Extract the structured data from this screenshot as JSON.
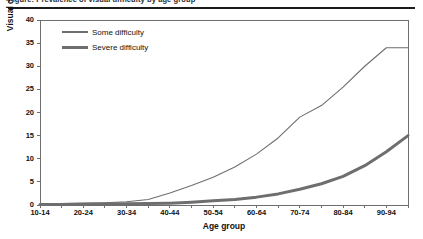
{
  "caption": {
    "text": "Figure: Prevalence of visual difficulty by age group"
  },
  "chart_data": {
    "type": "line",
    "title": "",
    "xlabel": "Age group",
    "ylabel": "Visual difficulty (%)",
    "ylim": [
      0,
      40
    ],
    "yticks": [
      0,
      5,
      10,
      15,
      20,
      25,
      30,
      35,
      40
    ],
    "grid": false,
    "legend_position": "top-left",
    "categories": [
      "10-14",
      "15-19",
      "20-24",
      "25-29",
      "30-34",
      "35-39",
      "40-44",
      "45-49",
      "50-54",
      "55-59",
      "60-64",
      "65-69",
      "70-74",
      "75-79",
      "80-84",
      "85-89",
      "90-94",
      "95+"
    ],
    "xtick_labels": [
      "10-14",
      "20-24",
      "30-34",
      "40-44",
      "50-54",
      "60-64",
      "70-74",
      "80-84",
      "90-94"
    ],
    "series": [
      {
        "name": "Some difficulty",
        "color": "#6e6e6e",
        "width": 1.1,
        "values": [
          0.2,
          0.3,
          0.4,
          0.5,
          0.7,
          1.2,
          2.6,
          4.2,
          6.0,
          8.2,
          11.0,
          14.5,
          19.0,
          21.5,
          25.5,
          30.0,
          34.0,
          34.0
        ]
      },
      {
        "name": "Severe difficulty",
        "color": "#6e6e6e",
        "width": 3.0,
        "values": [
          0.1,
          0.1,
          0.15,
          0.2,
          0.25,
          0.3,
          0.4,
          0.6,
          0.9,
          1.2,
          1.7,
          2.4,
          3.4,
          4.6,
          6.2,
          8.5,
          11.5,
          15.0
        ]
      }
    ]
  },
  "axis_colors": {
    "axis": "#6e6e6e",
    "text": "#111111"
  }
}
